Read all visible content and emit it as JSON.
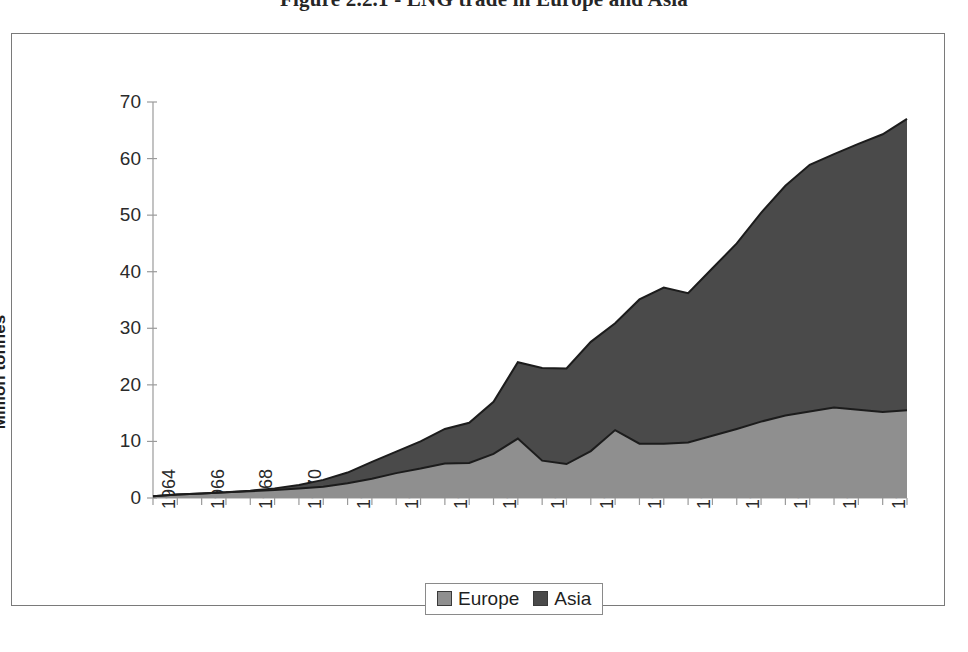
{
  "figure": {
    "caption": "Figure 2.2.1 - LNG trade in Europe and Asia"
  },
  "colors": {
    "europe_fill": "#8f8f8f",
    "asia_fill": "#4a4a4a",
    "series_outline": "#1c1c1c",
    "axis": "#9a9a9a",
    "frame": "#7a7a7a",
    "text": "#1f1f1f"
  },
  "axes": {
    "y_title": "Million tonnes",
    "y_ticks": [
      "0",
      "10",
      "20",
      "30",
      "40",
      "50",
      "60",
      "70"
    ],
    "x_ticks": [
      "1964",
      "1966",
      "1968",
      "1970",
      "1972",
      "1974",
      "1976",
      "1978",
      "1980",
      "1982",
      "1984",
      "1986",
      "1988",
      "1990",
      "1992",
      "1994"
    ]
  },
  "legend": {
    "items": [
      {
        "label": "Europe",
        "color": "#8f8f8f"
      },
      {
        "label": "Asia",
        "color": "#4a4a4a"
      }
    ]
  },
  "chart_data": {
    "type": "area",
    "stacked": true,
    "title": "Figure 2.2.1 - LNG trade in Europe and Asia",
    "xlabel": "",
    "ylabel": "Million tonnes",
    "ylim": [
      0,
      70
    ],
    "xlim": [
      1964,
      1995
    ],
    "grid": false,
    "legend_position": "bottom",
    "x": [
      1964,
      1965,
      1966,
      1967,
      1968,
      1969,
      1970,
      1971,
      1972,
      1973,
      1974,
      1975,
      1976,
      1977,
      1978,
      1979,
      1980,
      1981,
      1982,
      1983,
      1984,
      1985,
      1986,
      1987,
      1988,
      1989,
      1990,
      1991,
      1992,
      1993,
      1994,
      1995
    ],
    "categories": [
      "1964",
      "1965",
      "1966",
      "1967",
      "1968",
      "1969",
      "1970",
      "1971",
      "1972",
      "1973",
      "1974",
      "1975",
      "1976",
      "1977",
      "1978",
      "1979",
      "1980",
      "1981",
      "1982",
      "1983",
      "1984",
      "1985",
      "1986",
      "1987",
      "1988",
      "1989",
      "1990",
      "1991",
      "1992",
      "1993",
      "1994",
      "1995"
    ],
    "series": [
      {
        "name": "Europe",
        "color": "#8f8f8f",
        "values": [
          0.3,
          0.6,
          0.8,
          1.0,
          1.2,
          1.4,
          1.7,
          2.0,
          2.6,
          3.4,
          4.4,
          5.2,
          6.1,
          6.2,
          7.8,
          10.5,
          6.6,
          6.0,
          8.3,
          12.0,
          9.6,
          9.6,
          9.8,
          11.0,
          12.2,
          13.5,
          14.6,
          15.3,
          16.0,
          15.6,
          15.2,
          15.5
        ]
      },
      {
        "name": "Asia",
        "color": "#4a4a4a",
        "values": [
          0.0,
          0.0,
          0.0,
          0.0,
          0.1,
          0.3,
          0.6,
          1.2,
          1.9,
          3.0,
          3.8,
          4.8,
          6.1,
          7.1,
          9.2,
          13.5,
          16.4,
          16.9,
          19.3,
          18.9,
          25.5,
          27.6,
          26.4,
          29.6,
          32.8,
          36.9,
          40.6,
          43.6,
          44.8,
          47.0,
          49.1,
          51.5
        ]
      }
    ],
    "totals": [
      0.3,
      0.6,
      0.8,
      1.0,
      1.3,
      1.7,
      2.3,
      3.2,
      4.5,
      6.4,
      8.2,
      10.0,
      12.2,
      13.3,
      17.0,
      24.0,
      23.0,
      22.9,
      27.6,
      30.9,
      35.1,
      37.2,
      36.2,
      40.6,
      45.0,
      50.4,
      55.2,
      58.9,
      60.8,
      62.6,
      64.3,
      67.0
    ]
  }
}
